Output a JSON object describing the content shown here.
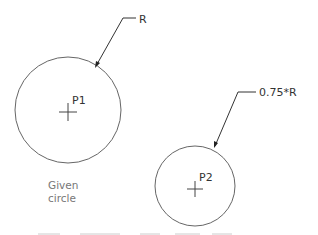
{
  "diagram": {
    "colors": {
      "line": "#555555",
      "text": "#333333",
      "caption": "#777777"
    },
    "circle1": {
      "label": "P1",
      "leader_text": "R",
      "caption_line1": "Given",
      "caption_line2": "circle"
    },
    "circle2": {
      "label": "P2",
      "leader_text": "0.75*R"
    }
  }
}
